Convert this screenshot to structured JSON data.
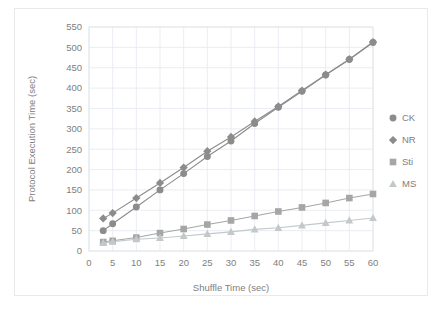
{
  "chart_data": {
    "type": "line",
    "title": "",
    "xlabel": "Shuffle Time (sec)",
    "ylabel": "Protocol Execution Time (sec)",
    "x": [
      3,
      5,
      10,
      15,
      20,
      25,
      30,
      35,
      40,
      45,
      50,
      55,
      60
    ],
    "xlim": [
      0,
      60
    ],
    "ylim": [
      0,
      550
    ],
    "xticks": [
      0,
      5,
      10,
      15,
      20,
      25,
      30,
      35,
      40,
      45,
      50,
      55,
      60
    ],
    "yticks": [
      0,
      50,
      100,
      150,
      200,
      250,
      300,
      350,
      400,
      450,
      500,
      550
    ],
    "grid": true,
    "legend_position": "right",
    "series": [
      {
        "name": "CK",
        "marker": "circle",
        "color": "#8c8c8c",
        "values": [
          50,
          67,
          108,
          150,
          190,
          232,
          270,
          313,
          353,
          392,
          432,
          470,
          512
        ]
      },
      {
        "name": "NR",
        "marker": "diamond",
        "color": "#8c8c8c",
        "values": [
          80,
          93,
          130,
          167,
          205,
          245,
          280,
          318,
          355,
          394,
          433,
          471,
          513
        ]
      },
      {
        "name": "Sti",
        "marker": "square",
        "color": "#a6a6a6",
        "values": [
          22,
          25,
          33,
          44,
          54,
          65,
          75,
          86,
          97,
          107,
          118,
          130,
          140
        ]
      },
      {
        "name": "MS",
        "marker": "triangle",
        "color": "#c3c9c9",
        "values": [
          20,
          23,
          29,
          32,
          37,
          42,
          47,
          53,
          57,
          63,
          69,
          75,
          81
        ]
      }
    ]
  },
  "legend": {
    "items": [
      {
        "label": "CK"
      },
      {
        "label": "NR"
      },
      {
        "label": "Sti"
      },
      {
        "label": "MS"
      }
    ]
  }
}
